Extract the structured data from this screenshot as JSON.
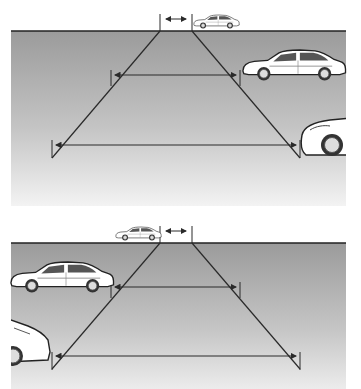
{
  "figure": {
    "panels": [
      {
        "id": "top",
        "parked_side": "right",
        "cars": [
          "distant-car",
          "mid-car",
          "near-car-partial"
        ]
      },
      {
        "id": "bottom",
        "parked_side": "left",
        "cars": [
          "distant-car",
          "mid-car",
          "near-car-partial"
        ]
      }
    ],
    "colors": {
      "ground_top": "#9e9e9e",
      "ground_bottom": "#f2f2f2",
      "line": "#2a2a2a",
      "car_body": "#ffffff",
      "car_outline": "#222222"
    }
  }
}
